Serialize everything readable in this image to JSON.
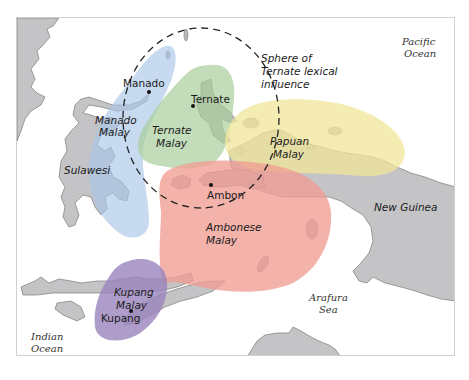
{
  "map": {
    "title": "",
    "regions": [
      {
        "id": "manado",
        "label_line1": "Manado",
        "label_line2": "Malay",
        "color": "#a9c6e8"
      },
      {
        "id": "ternate",
        "label_line1": "Ternate",
        "label_line2": "Malay",
        "color": "#a9cf9c"
      },
      {
        "id": "papuan",
        "label_line1": "Papuan",
        "label_line2": "Malay",
        "color": "#f1e69a"
      },
      {
        "id": "ambonese",
        "label_line1": "Ambonese",
        "label_line2": "Malay",
        "color": "#ef9c92"
      },
      {
        "id": "kupang",
        "label_line1": "Kupang",
        "label_line2": "Malay",
        "color": "#9a83bd"
      }
    ],
    "cities": {
      "manado": "Manado",
      "ternate": "Ternate",
      "ambon": "Ambon",
      "kupang": "Kupang"
    },
    "landmasses": {
      "sulawesi": "Sulawesi",
      "new_guinea": "New Guinea"
    },
    "water": {
      "pacific_line1": "Pacific",
      "pacific_line2": "Ocean",
      "indian_line1": "Indian",
      "indian_line2": "Ocean",
      "arafura_line1": "Arafura",
      "arafura_line2": "Sea"
    },
    "sphere": {
      "line1": "Sphere of",
      "line2": "Ternate lexical",
      "line3": "influence",
      "style": "dashed circle"
    },
    "colors": {
      "land": "#c4c4c7",
      "land_outline": "#6a6a6a",
      "water": "#ffffff",
      "frame": "#cfcfcf"
    }
  }
}
